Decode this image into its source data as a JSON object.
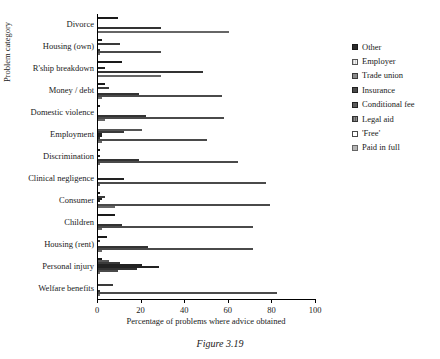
{
  "caption": "Figure 3.19",
  "chart_data": {
    "type": "bar",
    "orientation": "horizontal",
    "grouped": true,
    "title": "",
    "xlabel": "Percentage of problems where advice obtained",
    "ylabel": "Problem category",
    "xlim": [
      0,
      100
    ],
    "xticks": [
      0,
      20,
      40,
      60,
      80,
      100
    ],
    "grid": false,
    "legend_position": "right",
    "categories": [
      "Divorce",
      "Housing (own)",
      "R'ship breakdown",
      "Money / debt",
      "Domestic violence",
      "Employment",
      "Discrimination",
      "Clinical negligence",
      "Consumer",
      "Children",
      "Housing (rent)",
      "Personal injury",
      "Welfare benefits"
    ],
    "series": [
      {
        "name": "Other",
        "color": "#2b2b2b",
        "pattern": "solid-dark",
        "values": [
          9,
          2,
          11,
          3,
          1,
          0,
          1,
          0,
          1,
          8,
          4,
          2,
          0
        ]
      },
      {
        "name": "Employer",
        "color": "#d8d8d8",
        "pattern": "light-grid",
        "values": [
          0,
          0,
          0,
          0,
          0,
          20,
          0,
          0,
          0,
          0,
          0,
          5,
          0
        ]
      },
      {
        "name": "Trade union",
        "color": "#8a8a8a",
        "pattern": "mid-grey",
        "values": [
          0,
          10,
          0,
          5,
          0,
          12,
          0,
          0,
          3,
          0,
          1,
          10,
          7
        ]
      },
      {
        "name": "Insurance",
        "color": "#4a4a4a",
        "pattern": "dark-grey",
        "values": [
          0,
          0,
          3,
          0,
          0,
          2,
          1,
          0,
          2,
          0,
          0,
          20,
          0
        ]
      },
      {
        "name": "Conditional fee",
        "color": "#5c5c5c",
        "pattern": "dark-grey",
        "values": [
          0,
          0,
          0,
          0,
          0,
          2,
          0,
          12,
          1,
          0,
          0,
          28,
          0
        ]
      },
      {
        "name": "Legal aid",
        "color": "#6e6e6e",
        "pattern": "hatch-grey",
        "values": [
          29,
          1,
          48,
          19,
          22,
          1,
          19,
          0,
          0,
          11,
          23,
          18,
          1
        ]
      },
      {
        "name": "'Free'",
        "color": "#ffffff",
        "pattern": "white-outline",
        "values": [
          0,
          29,
          0,
          57,
          58,
          50,
          64,
          77,
          79,
          71,
          71,
          9,
          82
        ]
      },
      {
        "name": "Paid in full",
        "color": "#b5b5b5",
        "pattern": "light-grey",
        "values": [
          60,
          1,
          29,
          2,
          3,
          2,
          1,
          1,
          8,
          2,
          2,
          1,
          1
        ]
      }
    ]
  }
}
